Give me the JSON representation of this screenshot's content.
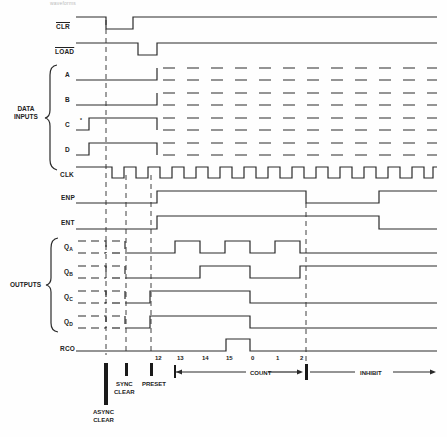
{
  "header_fragment": "waveforms",
  "signals": {
    "clr": "CLR",
    "load": "LOAD",
    "a": "A",
    "b": "B",
    "c": "C",
    "d": "D",
    "clk": "CLK",
    "enp": "ENP",
    "ent": "ENT",
    "qa": {
      "base": "Q",
      "sub": "A"
    },
    "qb": {
      "base": "Q",
      "sub": "B"
    },
    "qc": {
      "base": "Q",
      "sub": "C"
    },
    "qd": {
      "base": "Q",
      "sub": "D"
    },
    "rco": "RCO"
  },
  "groups": {
    "data_inputs": [
      "DATA",
      "INPUTS"
    ],
    "outputs": "OUTPUTS"
  },
  "count_ticks": [
    "12",
    "13",
    "14",
    "15",
    "0",
    "1",
    "2"
  ],
  "annotations": {
    "async_clear": [
      "ASYNC",
      "CLEAR"
    ],
    "sync_clear": [
      "SYNC",
      "CLEAR"
    ],
    "preset": "PRESET",
    "count": "COUNT",
    "inhibit": "INHIBIT"
  },
  "marker": "*"
}
